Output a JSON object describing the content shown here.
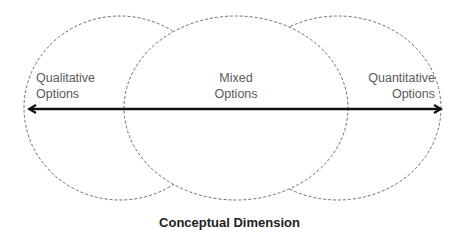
{
  "diagram": {
    "type": "overlapping-ellipses-on-axis",
    "regions": [
      {
        "id": "qualitative",
        "line1": "Qualitative",
        "line2": "Options"
      },
      {
        "id": "mixed",
        "line1": "Mixed",
        "line2": "Options"
      },
      {
        "id": "quantitative",
        "line1": "Quantitative",
        "line2": "Options"
      }
    ],
    "axis": {
      "direction": "bidirectional",
      "caption": "Conceptual Dimension"
    },
    "colors": {
      "ellipse_stroke": "#6e6e6e",
      "arrow": "#111111",
      "label_text": "#5a5a5a",
      "caption_text": "#222222",
      "background": "#ffffff"
    }
  }
}
